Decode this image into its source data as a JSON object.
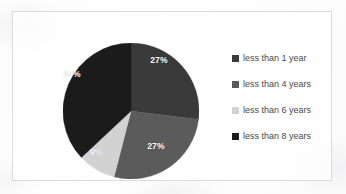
{
  "chart_data": {
    "type": "pie",
    "title": "",
    "subtitle": "",
    "xlabel": "",
    "ylabel": "",
    "grid": false,
    "legend_position": "right",
    "start_angle_deg": 0,
    "direction": "clockwise",
    "categories": [
      "less than 1 year",
      "less than 4 years",
      "less than 6 years",
      "less than 8 years"
    ],
    "values": [
      27,
      27,
      9,
      37
    ],
    "value_unit": "%",
    "data_labels": [
      "27%",
      "27%",
      "9%",
      "37%"
    ],
    "data_label_color": "#ffffff",
    "colors": [
      "#3a3a3a",
      "#5b5b5b",
      "#d2d2d2",
      "#1b1b1b"
    ],
    "slices": [
      {
        "label": "less than 1 year",
        "value": 27,
        "display": "27%",
        "color": "#3a3a3a",
        "label_x": 159,
        "label_y": 60
      },
      {
        "label": "less than 4 years",
        "value": 27,
        "display": "27%",
        "color": "#5b5b5b",
        "label_x": 156,
        "label_y": 146
      },
      {
        "label": "less than 6 years",
        "value": 9,
        "display": "9%",
        "color": "#d2d2d2",
        "label_x": 96,
        "label_y": 152
      },
      {
        "label": "less than 8 years",
        "value": 37,
        "display": "37%",
        "color": "#1b1b1b",
        "label_x": 72,
        "label_y": 74
      }
    ]
  },
  "legend": {
    "items": [
      {
        "label": "less than 1 year",
        "color": "#3a3a3a"
      },
      {
        "label": "less than 4 years",
        "color": "#5b5b5b"
      },
      {
        "label": "less than 6 years",
        "color": "#d2d2d2"
      },
      {
        "label": "less than 8 years",
        "color": "#1b1b1b"
      }
    ]
  },
  "frame": {
    "border_color": "#dcdcdc",
    "background_color": "#ffffff"
  }
}
